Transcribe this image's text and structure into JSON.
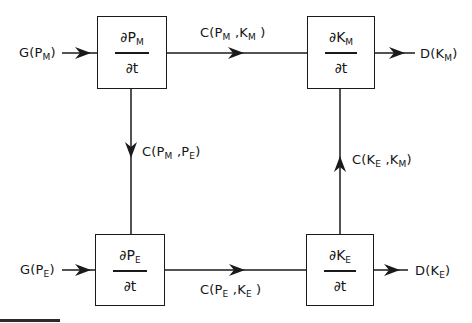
{
  "diagram": {
    "type": "flow-block-diagram",
    "nodes": [
      {
        "id": "PM",
        "numerator": "∂P",
        "num_sub": "M",
        "denominator": "∂t"
      },
      {
        "id": "KM",
        "numerator": "∂K",
        "num_sub": "M",
        "denominator": "∂t"
      },
      {
        "id": "PE",
        "numerator": "∂P",
        "num_sub": "E",
        "denominator": "∂t"
      },
      {
        "id": "KE",
        "numerator": "∂K",
        "num_sub": "E",
        "denominator": "∂t"
      }
    ],
    "inputs": [
      {
        "to": "PM",
        "label_main": "G(P",
        "label_sub": "M",
        "label_end": ")"
      },
      {
        "to": "PE",
        "label_main": "G(P",
        "label_sub": "E",
        "label_end": ")"
      }
    ],
    "outputs": [
      {
        "from": "KM",
        "label_main": "D(K",
        "label_sub": "M",
        "label_end": ")"
      },
      {
        "from": "KE",
        "label_main": "D(K",
        "label_sub": "E",
        "label_end": ")"
      }
    ],
    "edges": [
      {
        "from": "PM",
        "to": "KM",
        "a": "C(P",
        "a_sub": "M",
        "b": " ,K",
        "b_sub": "M",
        "end": " )"
      },
      {
        "from": "PM",
        "to": "PE",
        "a": "C(P",
        "a_sub": "M",
        "b": " ,P",
        "b_sub": "E",
        "end": ")"
      },
      {
        "from": "PE",
        "to": "KE",
        "a": "C(P",
        "a_sub": "E",
        "b": " ,K",
        "b_sub": "E",
        "end": " )"
      },
      {
        "from": "KE",
        "to": "KM",
        "a": "C(K",
        "a_sub": "E",
        "b": " ,K",
        "b_sub": "M",
        "end": ")"
      }
    ]
  }
}
